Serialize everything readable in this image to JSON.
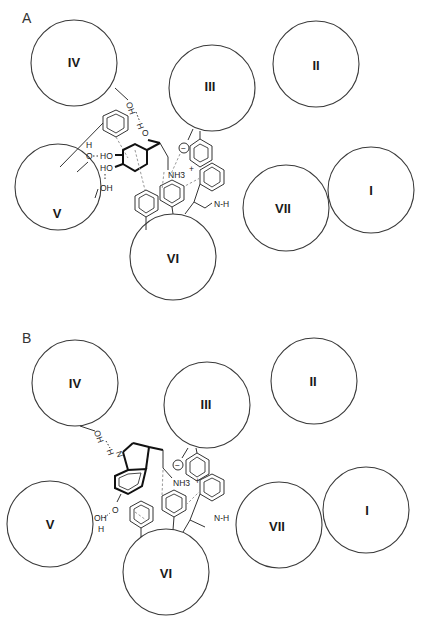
{
  "figure": {
    "panels": [
      {
        "id": "A",
        "label": "A",
        "ligand": "catecholamine (phenylethanolamine with catechol OH groups)",
        "sites": [
          {
            "label": "IV",
            "cx": 74,
            "cy": 63,
            "r": 43
          },
          {
            "label": "III",
            "cx": 212,
            "cy": 88,
            "r": 43
          },
          {
            "label": "II",
            "cx": 316,
            "cy": 64,
            "r": 43
          },
          {
            "label": "V",
            "cx": 58,
            "cy": 187,
            "r": 43
          },
          {
            "label": "VII",
            "cx": 286,
            "cy": 184,
            "r": 43
          },
          {
            "label": "I",
            "cx": 371,
            "cy": 189,
            "r": 43
          },
          {
            "label": "VI",
            "cx": 173,
            "cy": 256,
            "r": 43
          }
        ],
        "atoms": {
          "oh_site4": "OH",
          "h_bridge": "H",
          "o_hydroxyl": "O",
          "h_site5": "H",
          "o_site5": "O",
          "ho_catechol1": "HO",
          "ho_catechol2": "HO",
          "oh_site5b": "OH",
          "nh3": "NH3",
          "plus": "+",
          "minus": "−",
          "indole_nh": "N-H"
        }
      },
      {
        "id": "B",
        "label": "B",
        "ligand": "serotonin (5-hydroxytryptamine, indole)",
        "sites": [
          {
            "label": "IV",
            "cx": 75,
            "cy": 383,
            "r": 43
          },
          {
            "label": "III",
            "cx": 207,
            "cy": 405,
            "r": 43
          },
          {
            "label": "II",
            "cx": 314,
            "cy": 381,
            "r": 43
          },
          {
            "label": "V",
            "cx": 50,
            "cy": 524,
            "r": 43
          },
          {
            "label": "VII",
            "cx": 279,
            "cy": 525,
            "r": 43
          },
          {
            "label": "I",
            "cx": 366,
            "cy": 510,
            "r": 43
          },
          {
            "label": "VI",
            "cx": 166,
            "cy": 571,
            "r": 43
          }
        ],
        "atoms": {
          "oh_site4": "OH",
          "h_bridge": "H",
          "n_indole": "N",
          "oh_site5": "OH",
          "h_site5": "H",
          "o_hydroxyl": "O",
          "nh3": "NH3",
          "plus": "+",
          "minus": "−",
          "indole_nh": "N-H"
        }
      }
    ]
  }
}
